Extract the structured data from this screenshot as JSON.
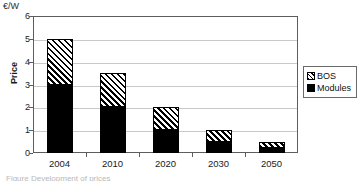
{
  "figure": {
    "unit_label": "€/W",
    "caption_fragment": "Figure    Development of prices"
  },
  "legend": {
    "position": "right",
    "entries": [
      {
        "label": "BOS",
        "swatch": "hatched-diagonal",
        "color": "#000000"
      },
      {
        "label": "Modules",
        "swatch": "solid-black",
        "color": "#000000"
      }
    ]
  },
  "chart_data": {
    "type": "bar",
    "stacked": true,
    "title": "",
    "xlabel": "",
    "ylabel": "Price",
    "unit": "€/W",
    "categories": [
      "2004",
      "2010",
      "2020",
      "2030",
      "2050"
    ],
    "series": [
      {
        "name": "Modules",
        "values": [
          3.0,
          2.0,
          1.0,
          0.5,
          0.22
        ]
      },
      {
        "name": "BOS",
        "values": [
          2.0,
          1.5,
          1.0,
          0.5,
          0.28
        ]
      }
    ],
    "totals": [
      5.0,
      3.5,
      2.0,
      1.0,
      0.5
    ],
    "ylim": [
      0,
      6
    ],
    "yticks": [
      "0",
      "1",
      "2",
      "3",
      "4",
      "5",
      "6"
    ],
    "ytick_values": [
      0,
      1,
      2,
      3,
      4,
      5,
      6
    ],
    "grid": true,
    "legend_position": "right"
  }
}
